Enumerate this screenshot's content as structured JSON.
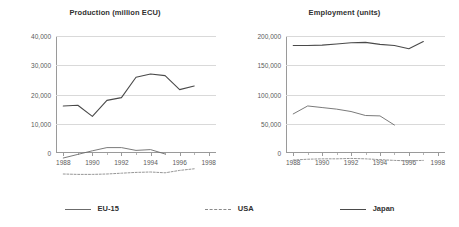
{
  "legend": {
    "position": "bottom-center",
    "items": [
      {
        "label": "EU-15",
        "style": "solid-thin",
        "color": "#6b6b6b",
        "swatch_name": "legend-swatch-eu15"
      },
      {
        "label": "USA",
        "style": "dashed",
        "color": "#8a8a8a",
        "swatch_name": "legend-swatch-usa"
      },
      {
        "label": "Japan",
        "style": "solid",
        "color": "#4a4a4a",
        "swatch_name": "legend-swatch-japan"
      }
    ]
  },
  "chart_data": [
    {
      "type": "line",
      "title": "Production (million ECU)",
      "xlabel": "",
      "ylabel": "",
      "x": [
        1988,
        1989,
        1990,
        1991,
        1992,
        1993,
        1994,
        1995,
        1996,
        1997
      ],
      "xlim": [
        1987.5,
        1998.5
      ],
      "ylim": [
        0,
        40000
      ],
      "xticks": [
        1988,
        1990,
        1992,
        1994,
        1996,
        1998
      ],
      "xticklabels": [
        "1988",
        "1990",
        "1992",
        "1994",
        "1996",
        "1998"
      ],
      "yticks": [
        0,
        10000,
        20000,
        30000,
        40000
      ],
      "yticklabels": [
        "0",
        "10,000",
        "20,000",
        "30,000",
        "40,000"
      ],
      "grid": true,
      "series": [
        {
          "name": "Japan",
          "style": "solid",
          "color": "#4a4a4a",
          "x": [
            1988,
            1989,
            1990,
            1991,
            1992,
            1993,
            1994,
            1995,
            1996,
            1997
          ],
          "values": [
            22500,
            22700,
            19900,
            23900,
            24600,
            29700,
            30500,
            30100,
            26600,
            27500
          ]
        },
        {
          "name": "EU-15",
          "style": "solid-thin",
          "color": "#6b6b6b",
          "x": [
            1988,
            1989,
            1990,
            1991,
            1992,
            1993,
            1994,
            1995
          ],
          "values": [
            9500,
            10400,
            11300,
            12100,
            12100,
            11400,
            11600,
            10500
          ]
        },
        {
          "name": "USA",
          "style": "dashed",
          "color": "#8a8a8a",
          "x": [
            1988,
            1989,
            1990,
            1991,
            1992,
            1993,
            1994,
            1995,
            1996,
            1997
          ],
          "values": [
            5500,
            5400,
            5400,
            5500,
            5700,
            5900,
            6000,
            5800,
            6400,
            6800
          ]
        }
      ]
    },
    {
      "type": "line",
      "title": "Employment (units)",
      "xlabel": "",
      "ylabel": "",
      "x": [
        1988,
        1989,
        1990,
        1991,
        1992,
        1993,
        1994,
        1995,
        1996,
        1997
      ],
      "xlim": [
        1987.5,
        1998.5
      ],
      "ylim": [
        0,
        200000
      ],
      "xticks": [
        1988,
        1990,
        1992,
        1994,
        1996,
        1998
      ],
      "xticklabels": [
        "1988",
        "1990",
        "1992",
        "1994",
        "1996",
        "1998"
      ],
      "yticks": [
        0,
        50000,
        100000,
        150000,
        200000
      ],
      "yticklabels": [
        "0",
        "50,000",
        "100,000",
        "150,000",
        "200,000"
      ],
      "grid": true,
      "series": [
        {
          "name": "Japan",
          "style": "solid",
          "color": "#4a4a4a",
          "x": [
            1988,
            1989,
            1990,
            1991,
            1992,
            1993,
            1994,
            1995,
            1996,
            1997
          ],
          "values": [
            188000,
            188000,
            188500,
            190000,
            191500,
            192000,
            189500,
            188000,
            184000,
            193000
          ]
        },
        {
          "name": "EU-15",
          "style": "solid-thin",
          "color": "#6b6b6b",
          "x": [
            1988,
            1989,
            1990,
            1991,
            1992,
            1993,
            1994,
            1995
          ],
          "values": [
            102000,
            112000,
            110000,
            108000,
            105000,
            100000,
            99500,
            88000
          ]
        },
        {
          "name": "USA",
          "style": "dashed",
          "color": "#8a8a8a",
          "x": [
            1988,
            1989,
            1990,
            1991,
            1992,
            1993,
            1994,
            1995,
            1996,
            1997
          ],
          "values": [
            44000,
            45000,
            45500,
            45500,
            46000,
            45500,
            44500,
            43500,
            43000,
            43500
          ]
        }
      ]
    }
  ]
}
